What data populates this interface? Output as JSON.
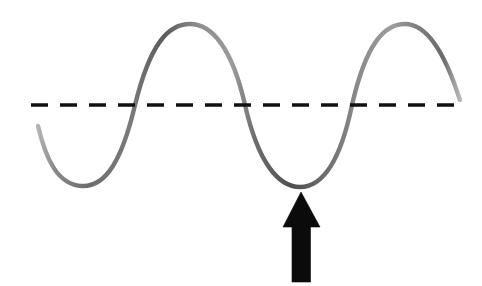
{
  "figure": {
    "background_color": "#ffffff",
    "width": 482,
    "height": 286
  },
  "equilibrium_line": {
    "label": "equilibrium-line",
    "color": "#111111",
    "y": 105,
    "x_start": 31,
    "x_end": 465,
    "stroke_width": 3.4,
    "dash_length": 17,
    "dash_gap": 12,
    "style": "dashed"
  },
  "wave": {
    "label": "sine-wave-curve",
    "color_light": "#8d8d8d",
    "color_mid": "#6f6f6f",
    "color_dark": "#4e4e4e",
    "stroke_width": 4.4,
    "path": "M 38 126 C 46 160, 58 185, 82 186 C 106 187, 122 160, 135 105 C 150 44, 168 24, 190 24 C 212 24, 232 48, 245 105 C 258 162, 278 187, 300 187 C 322 187, 340 163, 352 105 C 366 44, 384 24, 405 24 C 426 24, 444 50, 460 100"
  },
  "chart_data": {
    "type": "line",
    "xlabel": "",
    "ylabel": "",
    "xlim": [
      0,
      482
    ],
    "ylim": [
      286,
      0
    ],
    "grid": false,
    "legend": "none",
    "series": [
      {
        "name": "wave",
        "x": [
          38,
          82,
          135,
          190,
          245,
          300,
          352,
          405,
          460
        ],
        "y": [
          126,
          186,
          105,
          24,
          105,
          187,
          105,
          24,
          100
        ]
      }
    ],
    "reference_lines": [
      {
        "name": "equilibrium",
        "orientation": "horizontal",
        "y": 105,
        "style": "dashed",
        "color": "#111111"
      }
    ],
    "annotations": [
      {
        "name": "trough-arrow",
        "type": "arrow",
        "points_to_x": 301,
        "points_to_y": 192,
        "direction": "up",
        "color": "#0b0b0b"
      }
    ],
    "features": {
      "crests": [
        {
          "x": 190,
          "y": 24
        },
        {
          "x": 405,
          "y": 24
        }
      ],
      "troughs": [
        {
          "x": 82,
          "y": 186
        },
        {
          "x": 300,
          "y": 187
        }
      ],
      "zero_crossings": [
        135,
        245,
        352
      ],
      "cycles_shown": 2
    }
  },
  "arrow": {
    "label": "trough-indicator-arrow",
    "color": "#0b0b0b",
    "direction": "up",
    "apex_x": 301,
    "apex_y": 192,
    "head_left_x": 283,
    "head_right_x": 320,
    "head_base_y": 227,
    "shaft_left_x": 292,
    "shaft_right_x": 310,
    "shaft_bottom_y": 282,
    "path": "M 301 192 L 320 227 L 310.5 227 L 310.5 282 L 292 282 L 292 227 L 283 227 Z"
  },
  "accessibility": {
    "alt_text": "A gray sine wave drawn across a white background, crossed by a horizontal black dashed line representing the equilibrium position. A solid black arrow points upward at the second trough of the wave."
  }
}
